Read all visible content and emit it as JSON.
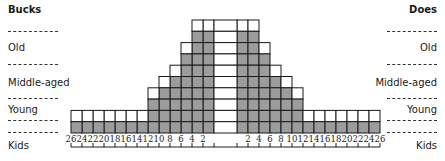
{
  "labels": {
    "left_title": "Bucks",
    "right_title": "Does",
    "left": [
      "Old",
      "Middle-aged",
      "Young",
      "Kids"
    ],
    "right": [
      "Old",
      "Middle-aged",
      "Young",
      "Kids"
    ]
  },
  "colors": {
    "shaded": "#9c9c9c",
    "unshaded": "#ffffff",
    "grid_line": "#1a1a1a"
  },
  "chart_data": {
    "type": "population-pyramid",
    "title": "",
    "left_series": "Bucks",
    "right_series": "Does",
    "age_classes_top_to_bottom": [
      "Old",
      "Middle-aged",
      "Young",
      "Kids"
    ],
    "x_tick_labels_left": [
      "26",
      "24",
      "22",
      "20",
      "18",
      "16",
      "14",
      "12",
      "10",
      "8",
      "6",
      "4",
      "2"
    ],
    "x_tick_labels_right": [
      "2",
      "4",
      "6",
      "8",
      "10",
      "12",
      "14",
      "16",
      "18",
      "20",
      "22",
      "24",
      "26"
    ],
    "cell_unit": 2,
    "rows_top_to_bottom": [
      {
        "total_cells": 2,
        "shaded_cells": 0
      },
      {
        "total_cells": 2,
        "shaded_cells": 2
      },
      {
        "total_cells": 3,
        "shaded_cells": 2
      },
      {
        "total_cells": 3,
        "shaded_cells": 3
      },
      {
        "total_cells": 4,
        "shaded_cells": 3
      },
      {
        "total_cells": 5,
        "shaded_cells": 4
      },
      {
        "total_cells": 6,
        "shaded_cells": 5
      },
      {
        "total_cells": 6,
        "shaded_cells": 6
      },
      {
        "total_cells": 13,
        "shaded_cells": 6
      },
      {
        "total_cells": 13,
        "shaded_cells": 13
      }
    ],
    "symmetric": true,
    "xlim": [
      -26,
      26
    ]
  }
}
